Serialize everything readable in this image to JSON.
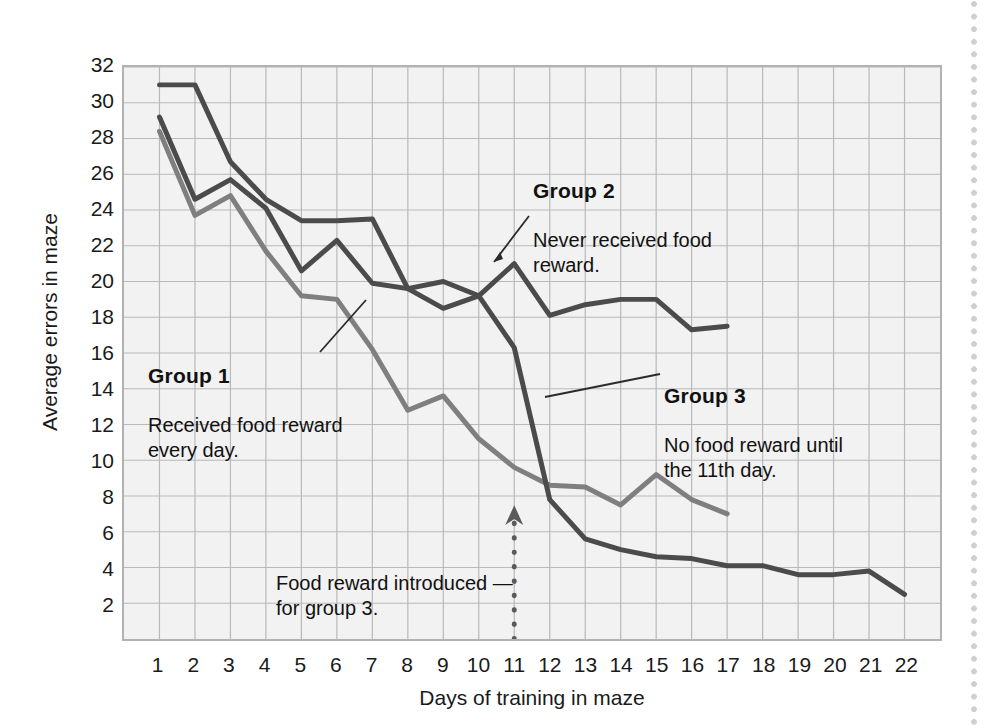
{
  "chart_data": {
    "type": "line",
    "title": "",
    "xlabel": "Days of training in maze",
    "ylabel": "Average errors in maze",
    "x": [
      1,
      2,
      3,
      4,
      5,
      6,
      7,
      8,
      9,
      10,
      11,
      12,
      13,
      14,
      15,
      16,
      17,
      18,
      19,
      20,
      21,
      22
    ],
    "xlim": [
      1,
      22
    ],
    "ylim": [
      0,
      32
    ],
    "xticks": [
      "1",
      "2",
      "3",
      "4",
      "5",
      "6",
      "7",
      "8",
      "9",
      "10",
      "11",
      "12",
      "13",
      "14",
      "15",
      "16",
      "17",
      "18",
      "19",
      "20",
      "21",
      "22"
    ],
    "yticks": [
      "2",
      "4",
      "6",
      "8",
      "10",
      "12",
      "14",
      "16",
      "18",
      "20",
      "22",
      "24",
      "26",
      "28",
      "30",
      "32"
    ],
    "grid": true,
    "legend_position": "inline-annotations",
    "series": [
      {
        "name": "Group 1",
        "color": "#7f7f7f",
        "x": [
          1,
          2,
          3,
          4,
          5,
          6,
          7,
          8,
          9,
          10,
          11,
          12,
          13,
          14,
          15,
          16,
          17
        ],
        "values": [
          28.4,
          23.7,
          24.8,
          21.7,
          19.2,
          19.0,
          16.2,
          12.8,
          13.6,
          11.2,
          9.6,
          8.6,
          8.5,
          7.5,
          9.2,
          7.8,
          7.0
        ]
      },
      {
        "name": "Group 2",
        "color": "#4b4b4b",
        "x": [
          1,
          2,
          3,
          4,
          5,
          6,
          7,
          8,
          9,
          10,
          11,
          12,
          13,
          14,
          15,
          16,
          17
        ],
        "values": [
          31.0,
          31.0,
          26.7,
          24.6,
          23.4,
          23.4,
          23.5,
          19.6,
          20.0,
          19.2,
          21.0,
          18.1,
          18.7,
          19.0,
          19.0,
          17.3,
          17.5
        ]
      },
      {
        "name": "Group 3",
        "color": "#4b4b4b",
        "x": [
          1,
          2,
          3,
          4,
          5,
          6,
          7,
          8,
          9,
          10,
          11,
          12,
          13,
          14,
          15,
          16,
          17,
          18,
          19,
          20,
          21,
          22
        ],
        "values": [
          29.2,
          24.6,
          25.7,
          24.1,
          20.6,
          22.3,
          19.9,
          19.6,
          18.5,
          19.2,
          16.3,
          7.8,
          5.6,
          5.0,
          4.6,
          4.5,
          4.1,
          4.1,
          3.6,
          3.6,
          3.8,
          2.5
        ]
      }
    ],
    "marker_line": {
      "x": 11,
      "label": "Food reward introduced for group 3."
    }
  },
  "annotations": {
    "group1": {
      "title": "Group 1",
      "body": "Received food reward\nevery day."
    },
    "group2": {
      "title": "Group 2",
      "body": "Never received food\nreward."
    },
    "group3": {
      "title": "Group 3",
      "body": "No food reward until\nthe 11th day."
    },
    "reward": "Food reward introduced —\nfor group 3."
  }
}
